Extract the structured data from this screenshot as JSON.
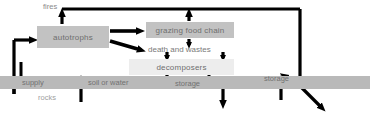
{
  "diagram": {
    "background": "#ffffff",
    "box_fill": "#c2c2c2",
    "box_light_fill": "#ededed",
    "band_fill": "#b9b9b9",
    "arrow_color": "#000000",
    "text_color": "#6e6e6e"
  },
  "nodes": {
    "fires": "fires",
    "autotrophs": "autotrophs",
    "grazing_food_chain": "grazing food chain",
    "death_and_wastes": "death and wastes",
    "decomposers": "decomposers"
  },
  "band": {
    "supply": "supply",
    "rocks": "rocks",
    "soil_or_water": "soil or water",
    "storage_left": "storage",
    "storage_right": "storage"
  }
}
